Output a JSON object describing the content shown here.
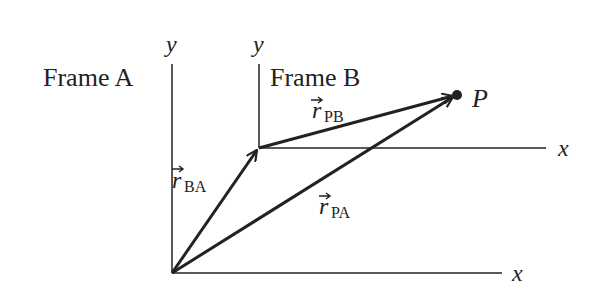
{
  "diagram": {
    "type": "relative-position-vectors",
    "colors": {
      "ink": "#222222",
      "background": "#ffffff"
    },
    "frame_a": {
      "label": "Frame A",
      "y_axis_label": "y",
      "x_axis_label": "x"
    },
    "frame_b": {
      "label": "Frame B",
      "y_axis_label": "y",
      "x_axis_label": "x"
    },
    "point": {
      "label": "P"
    },
    "vectors": [
      {
        "id": "r_BA",
        "symbol": "r",
        "subscript": "BA",
        "from": "origin A",
        "to": "origin B"
      },
      {
        "id": "r_PB",
        "symbol": "r",
        "subscript": "PB",
        "from": "origin B",
        "to": "P"
      },
      {
        "id": "r_PA",
        "symbol": "r",
        "subscript": "PA",
        "from": "origin A",
        "to": "P"
      }
    ]
  }
}
